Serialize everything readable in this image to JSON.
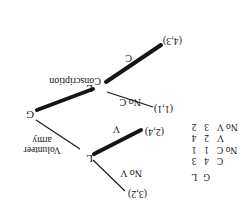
{
  "figure": {
    "orientation": "rotated-180"
  },
  "tree": {
    "root": {
      "label": "G",
      "name": "government-node"
    },
    "nodes": [
      {
        "label": "L",
        "name": "citizen-node-left"
      },
      {
        "label": "L",
        "name": "citizen-node-right"
      }
    ],
    "edges": [
      {
        "label": "Conscription",
        "name": "edge-conscription",
        "bold": true
      },
      {
        "label": "Volunteer army",
        "label_line1": "Volunteer",
        "label_line2": "army",
        "name": "edge-volunteer-army",
        "bold": false
      },
      {
        "label": "C",
        "name": "edge-c",
        "bold": true
      },
      {
        "label": "No C",
        "name": "edge-no-c",
        "bold": false
      },
      {
        "label": "V",
        "name": "edge-v",
        "bold": true
      },
      {
        "label": "No V",
        "name": "edge-no-v",
        "bold": false
      }
    ],
    "outcomes": [
      {
        "label": "(4,3)",
        "name": "payoff-c"
      },
      {
        "label": "(1,1)",
        "name": "payoff-no-c"
      },
      {
        "label": "(2,4)",
        "name": "payoff-v"
      },
      {
        "label": "(3,2)",
        "name": "payoff-no-v"
      }
    ]
  },
  "matrix": {
    "columns": [
      "G",
      "L"
    ],
    "rows": [
      {
        "label": "C",
        "values": [
          "4",
          "3"
        ]
      },
      {
        "label": "No C",
        "values": [
          "1",
          "1"
        ]
      },
      {
        "label": "V",
        "values": [
          "2",
          "4"
        ]
      },
      {
        "label": "No V",
        "values": [
          "3",
          "2"
        ]
      }
    ]
  }
}
